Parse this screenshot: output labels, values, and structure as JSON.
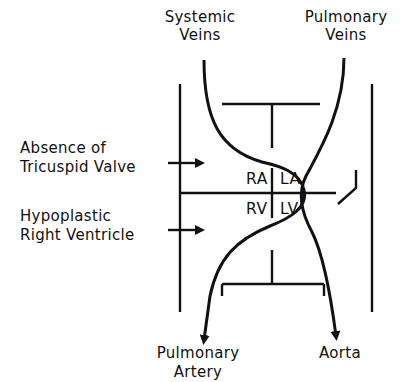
{
  "diagram": {
    "type": "anatomical-flow-schematic",
    "colors": {
      "ink": "#111111",
      "background": "#ffffff"
    },
    "labels": {
      "systemic_veins": [
        "Systemic",
        "Veins"
      ],
      "pulmonary_veins": [
        "Pulmonary",
        "Veins"
      ],
      "pulmonary_artery": [
        "Pulmonary",
        "Artery"
      ],
      "aorta": "Aorta",
      "absence_tricuspid": [
        "Absence of",
        "Tricuspid Valve"
      ],
      "hypoplastic_rv": [
        "Hypoplastic",
        "Right Ventricle"
      ]
    },
    "chambers": {
      "ra": "RA",
      "la": "LA",
      "rv": "RV",
      "lv": "LV"
    },
    "flows": [
      {
        "from": "Systemic Veins",
        "to": "RA"
      },
      {
        "from": "RA",
        "to": "LA",
        "via": "atrial communication"
      },
      {
        "from": "Pulmonary Veins",
        "to": "LA"
      },
      {
        "from": "LA",
        "to": "LV"
      },
      {
        "from": "LV",
        "to": "RV",
        "via": "ventricular communication"
      },
      {
        "from": "RV",
        "to": "Pulmonary Artery"
      },
      {
        "from": "LV",
        "to": "Aorta"
      }
    ]
  }
}
